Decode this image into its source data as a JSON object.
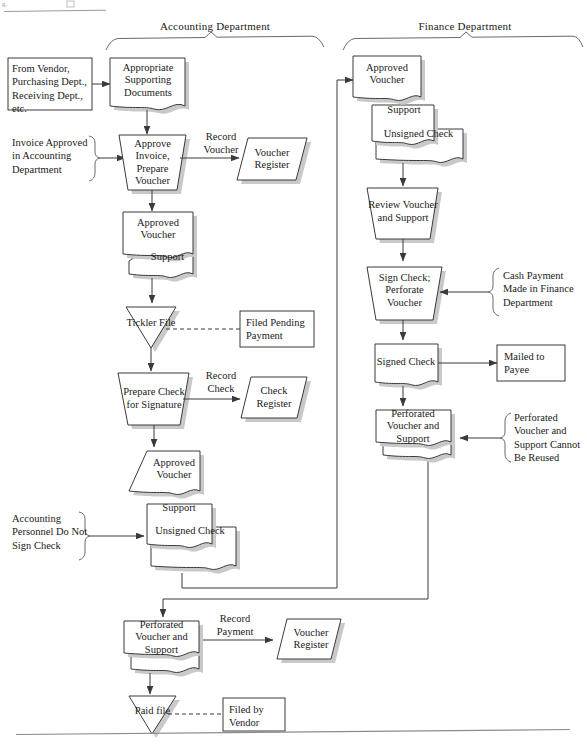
{
  "page": {
    "header_fragment": "g.",
    "background": "#ffffff",
    "line_color": "#3a3a3a",
    "shadow_color": "#c9c9c9"
  },
  "departments": [
    {
      "id": "accounting",
      "label": "Accounting Department"
    },
    {
      "id": "finance",
      "label": "Finance Department"
    }
  ],
  "accounting": {
    "source_note": "From Vendor,\nPurchasing\nDept., Receiving\nDept., etc.",
    "invoice_note": "Invoice\nApproved\nin Accounting\nDepartment",
    "personnel_note": "Accounting\nPersonnel\nDo Not Sign\nCheck",
    "nodes": [
      {
        "id": "supporting-documents",
        "shape": "document",
        "label": "Appropriate\nSupporting\nDocuments"
      },
      {
        "id": "approve-invoice",
        "shape": "process-trapezoid",
        "label": "Approve\nInvoice,\nPrepare\nVoucher"
      },
      {
        "id": "voucher-register-1",
        "shape": "parallelogram",
        "label": "Voucher\nRegister"
      },
      {
        "id": "approved-voucher-stack-1",
        "shape": "document-stack",
        "label": "Approved\nVoucher",
        "label2": "Support"
      },
      {
        "id": "tickler-file",
        "shape": "triangle",
        "label": "Tickler\nFile"
      },
      {
        "id": "filed-pending-payment",
        "shape": "rect-note",
        "label": "Filed Pending\nPayment"
      },
      {
        "id": "prepare-check",
        "shape": "process-trapezoid",
        "label": "Prepare\nCheck for\nSignature"
      },
      {
        "id": "check-register",
        "shape": "parallelogram",
        "label": "Check\nRegister"
      },
      {
        "id": "approved-voucher-stack-2",
        "shape": "document-stack-3",
        "label": "Approved\nVoucher",
        "label2": "Support",
        "label3": "Unsigned Check"
      },
      {
        "id": "perforated-voucher-support",
        "shape": "document-stack",
        "label": "Perforated\nVoucher and\nSupport"
      },
      {
        "id": "voucher-register-2",
        "shape": "parallelogram",
        "label": "Voucher\nRegister"
      },
      {
        "id": "paid-file",
        "shape": "triangle",
        "label": "Paid\nfile"
      },
      {
        "id": "filed-by-vendor",
        "shape": "rect-note",
        "label": "Filed by\nVendor"
      }
    ],
    "edge_labels": [
      {
        "id": "record-voucher",
        "label": "Record\nVoucher"
      },
      {
        "id": "record-check",
        "label": "Record\nCheck"
      },
      {
        "id": "record-payment",
        "label": "Record\nPayment"
      }
    ]
  },
  "finance": {
    "cash_payment_note": "Cash Payment\nMade in Finance\nDepartment",
    "perforated_note": "Perforated\nVoucher and\nSupport Cannot\nBe Reused",
    "nodes": [
      {
        "id": "approved-voucher-stack-fin",
        "shape": "document-stack-3",
        "label": "Approved\nVoucher",
        "label2": "Support",
        "label3": "Unsigned Check"
      },
      {
        "id": "review-voucher-support",
        "shape": "process-trapezoid",
        "label": "Review\nVoucher and\nSupport"
      },
      {
        "id": "sign-check-perforate",
        "shape": "process-trapezoid",
        "label": "Sign Check;\nPerforate\nVoucher"
      },
      {
        "id": "signed-check",
        "shape": "document",
        "label": "Signed\nCheck"
      },
      {
        "id": "mailed-to-payee",
        "shape": "rect-note",
        "label": "Mailed to\nPayee"
      },
      {
        "id": "perforated-voucher-support-fin",
        "shape": "document-stack",
        "label": "Perforated\nVoucher and\nSupport"
      }
    ]
  }
}
